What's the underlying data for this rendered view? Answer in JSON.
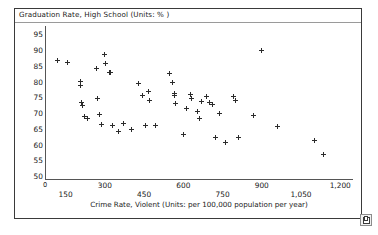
{
  "window": {
    "title": "Graduation Rate, High School (Units: % )",
    "resize_handle_icon": "resize-square-icon",
    "origin_label": "0"
  },
  "chart_data": {
    "type": "scatter",
    "title": "Graduation Rate, High School (Units: % )",
    "xlabel": "Crime Rate, Violent (Units: per 100,000 population per year)",
    "ylabel": "Graduation Rate, High School (Units: % )",
    "xlim": [
      75,
      1245
    ],
    "ylim": [
      50,
      97
    ],
    "grid": false,
    "legend": "none",
    "marker": "plus",
    "marker_color": "#2b2b2b",
    "xticks": [
      150,
      300,
      450,
      600,
      750,
      900,
      1050,
      1200
    ],
    "xtick_labels": [
      "150",
      "300",
      "450",
      "600",
      "750",
      "900",
      "1,050",
      "1,200"
    ],
    "xtick_rows": [
      1,
      0,
      1,
      0,
      1,
      0,
      1,
      0
    ],
    "yticks": [
      50,
      55,
      60,
      65,
      70,
      75,
      80,
      85,
      90,
      95
    ],
    "ytick_labels": [
      "50",
      "55",
      "60",
      "65",
      "70",
      "75",
      "80",
      "85",
      "90",
      "95"
    ],
    "points": [
      {
        "x": 118,
        "y": 87.0
      },
      {
        "x": 158,
        "y": 86.3
      },
      {
        "x": 205,
        "y": 80.3
      },
      {
        "x": 208,
        "y": 79.2
      },
      {
        "x": 210,
        "y": 73.7
      },
      {
        "x": 215,
        "y": 72.6
      },
      {
        "x": 223,
        "y": 69.3
      },
      {
        "x": 232,
        "y": 68.6
      },
      {
        "x": 268,
        "y": 84.4
      },
      {
        "x": 272,
        "y": 74.9
      },
      {
        "x": 280,
        "y": 69.9
      },
      {
        "x": 288,
        "y": 66.8
      },
      {
        "x": 300,
        "y": 88.8
      },
      {
        "x": 303,
        "y": 85.9
      },
      {
        "x": 318,
        "y": 83.3
      },
      {
        "x": 323,
        "y": 83.1
      },
      {
        "x": 330,
        "y": 66.2
      },
      {
        "x": 352,
        "y": 64.5
      },
      {
        "x": 372,
        "y": 67.0
      },
      {
        "x": 402,
        "y": 65.2
      },
      {
        "x": 430,
        "y": 79.6
      },
      {
        "x": 444,
        "y": 76.0
      },
      {
        "x": 455,
        "y": 66.5
      },
      {
        "x": 468,
        "y": 77.2
      },
      {
        "x": 470,
        "y": 74.2
      },
      {
        "x": 492,
        "y": 66.4
      },
      {
        "x": 548,
        "y": 83.0
      },
      {
        "x": 560,
        "y": 80.1
      },
      {
        "x": 565,
        "y": 76.5
      },
      {
        "x": 566,
        "y": 75.9
      },
      {
        "x": 572,
        "y": 73.3
      },
      {
        "x": 600,
        "y": 63.6
      },
      {
        "x": 612,
        "y": 71.9
      },
      {
        "x": 628,
        "y": 76.2
      },
      {
        "x": 632,
        "y": 75.0
      },
      {
        "x": 655,
        "y": 70.8
      },
      {
        "x": 660,
        "y": 68.6
      },
      {
        "x": 668,
        "y": 74.1
      },
      {
        "x": 690,
        "y": 75.5
      },
      {
        "x": 700,
        "y": 73.6
      },
      {
        "x": 712,
        "y": 73.0
      },
      {
        "x": 722,
        "y": 62.4
      },
      {
        "x": 740,
        "y": 70.2
      },
      {
        "x": 760,
        "y": 61.0
      },
      {
        "x": 790,
        "y": 75.6
      },
      {
        "x": 800,
        "y": 74.4
      },
      {
        "x": 812,
        "y": 62.6
      },
      {
        "x": 870,
        "y": 69.4
      },
      {
        "x": 898,
        "y": 90.2
      },
      {
        "x": 960,
        "y": 66.0
      },
      {
        "x": 1100,
        "y": 61.5
      },
      {
        "x": 1135,
        "y": 57.2
      }
    ]
  }
}
